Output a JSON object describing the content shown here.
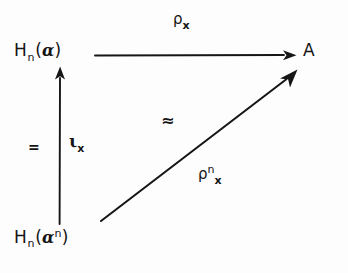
{
  "figure": {
    "kind": "commutative-diagram",
    "background_color": "#fdfdfd",
    "ink_color": "#161616",
    "width": 348,
    "height": 273
  },
  "nodes": {
    "top_left": {
      "name": "H_n(a)",
      "base": "H",
      "subscript": "n",
      "open_paren": "(",
      "ideal": "ɑ",
      "close_paren": ")"
    },
    "bottom_left": {
      "name": "H_n(a^n)",
      "base": "H",
      "subscript": "n",
      "open_paren": "(",
      "ideal": "ɑ",
      "superscript": "n",
      "close_paren": ")"
    },
    "right": {
      "name": "A",
      "label": "A"
    }
  },
  "arrows": {
    "horizontal": {
      "name": "rho-x",
      "direction": "left-to-right",
      "label_symbol": "ρ",
      "label_subscript": "x"
    },
    "vertical": {
      "name": "iota-x",
      "direction": "bottom-to-top",
      "label_symbol": "ι",
      "label_subscript": "x",
      "equality_mark": "="
    },
    "diagonal": {
      "name": "rho-n-x",
      "direction": "bottom-left-to-top-right",
      "tilde_symbol": "≈",
      "label_symbol": "ρ",
      "label_superscript": "n",
      "label_subscript": "x"
    }
  }
}
